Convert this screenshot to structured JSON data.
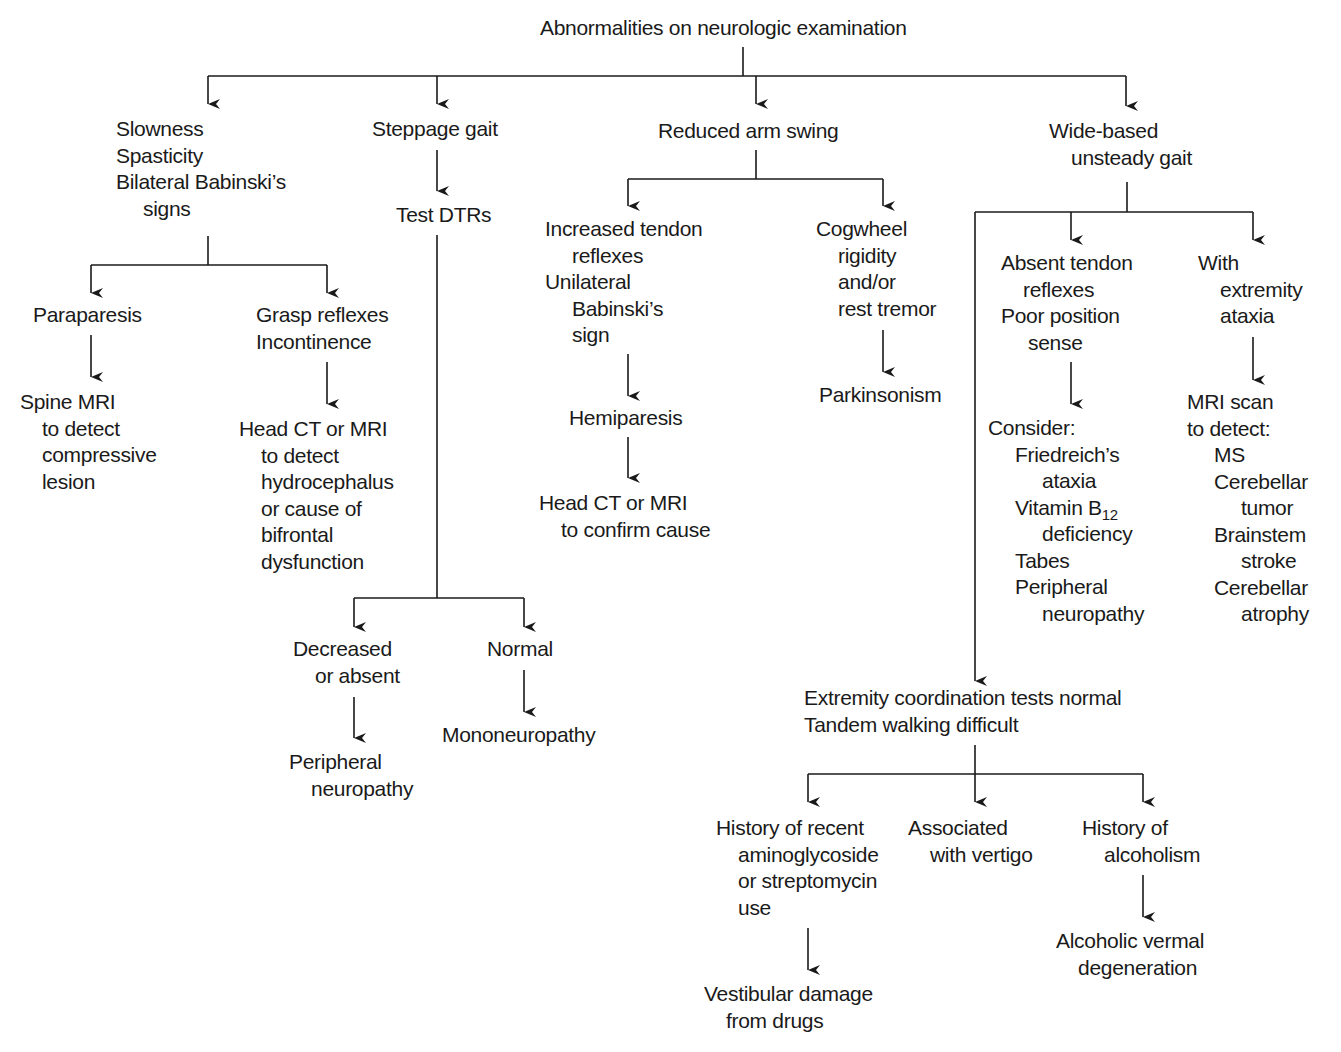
{
  "diagram": {
    "type": "flowchart",
    "root": {
      "id": "root",
      "lines": [
        "Abnormalities on neurologic examination"
      ]
    },
    "nodes": {
      "slowness": {
        "lines": [
          "Slowness",
          "Spasticity",
          "Bilateral Babinski’s",
          "signs"
        ]
      },
      "paraparesis": {
        "lines": [
          "Paraparesis"
        ]
      },
      "spine_mri": {
        "lines": [
          "Spine MRI",
          "to detect",
          "compressive",
          "lesion"
        ]
      },
      "grasp": {
        "lines": [
          "Grasp reflexes",
          "Incontinence"
        ]
      },
      "head_ct_hydro": {
        "lines": [
          "Head CT or MRI",
          "to detect",
          "hydrocephalus",
          "or cause of",
          "bifrontal",
          "dysfunction"
        ]
      },
      "steppage": {
        "lines": [
          "Steppage gait"
        ]
      },
      "test_dtrs": {
        "lines": [
          "Test DTRs"
        ]
      },
      "decreased": {
        "lines": [
          "Decreased",
          "or absent"
        ]
      },
      "peripheral_neuro_1": {
        "lines": [
          "Peripheral",
          "neuropathy"
        ]
      },
      "normal": {
        "lines": [
          "Normal"
        ]
      },
      "mononeuropathy": {
        "lines": [
          "Mononeuropathy"
        ]
      },
      "reduced_arm": {
        "lines": [
          "Reduced arm swing"
        ]
      },
      "increased_tendon": {
        "lines": [
          "Increased tendon",
          "reflexes",
          "Unilateral",
          "Babinski’s",
          "sign"
        ]
      },
      "hemiparesis": {
        "lines": [
          "Hemiparesis"
        ]
      },
      "head_ct_confirm": {
        "lines": [
          "Head CT or MRI",
          "to confirm cause"
        ]
      },
      "cogwheel": {
        "lines": [
          "Cogwheel",
          "rigidity",
          "and/or",
          "rest tremor"
        ]
      },
      "parkinsonism": {
        "lines": [
          "Parkinsonism"
        ]
      },
      "wide_based": {
        "lines": [
          "Wide-based",
          "unsteady gait"
        ]
      },
      "absent_tendon": {
        "lines": [
          "Absent tendon",
          "reflexes",
          "Poor position",
          "sense"
        ]
      },
      "consider": {
        "lines": [
          "Consider:",
          "Friedreich’s",
          "ataxia",
          "Vitamin B",
          "deficiency",
          "Tabes",
          "Peripheral",
          "neuropathy"
        ],
        "subscript": "12"
      },
      "extremity_ataxia": {
        "lines": [
          "With",
          "extremity",
          "ataxia"
        ]
      },
      "mri_scan": {
        "lines": [
          "MRI scan",
          "to detect:",
          "MS",
          "Cerebellar",
          "tumor",
          "Brainstem",
          "stroke",
          "Cerebellar",
          "atrophy"
        ]
      },
      "coordination_normal": {
        "lines": [
          "Extremity coordination tests normal",
          "Tandem walking difficult"
        ]
      },
      "aminoglycoside": {
        "lines": [
          "History of recent",
          "aminoglycoside",
          "or streptomycin",
          "use"
        ]
      },
      "vestibular": {
        "lines": [
          "Vestibular damage",
          "from drugs"
        ]
      },
      "vertigo": {
        "lines": [
          "Associated",
          "with vertigo"
        ]
      },
      "alcoholism": {
        "lines": [
          "History of",
          "alcoholism"
        ]
      },
      "vermal": {
        "lines": [
          "Alcoholic vermal",
          "degeneration"
        ]
      }
    },
    "edges": [
      [
        "root",
        "slowness"
      ],
      [
        "root",
        "steppage"
      ],
      [
        "root",
        "reduced_arm"
      ],
      [
        "root",
        "wide_based"
      ],
      [
        "slowness",
        "paraparesis"
      ],
      [
        "slowness",
        "grasp"
      ],
      [
        "paraparesis",
        "spine_mri"
      ],
      [
        "grasp",
        "head_ct_hydro"
      ],
      [
        "steppage",
        "test_dtrs"
      ],
      [
        "test_dtrs",
        "decreased"
      ],
      [
        "test_dtrs",
        "normal"
      ],
      [
        "decreased",
        "peripheral_neuro_1"
      ],
      [
        "normal",
        "mononeuropathy"
      ],
      [
        "reduced_arm",
        "increased_tendon"
      ],
      [
        "reduced_arm",
        "cogwheel"
      ],
      [
        "increased_tendon",
        "hemiparesis"
      ],
      [
        "hemiparesis",
        "head_ct_confirm"
      ],
      [
        "cogwheel",
        "parkinsonism"
      ],
      [
        "wide_based",
        "absent_tendon"
      ],
      [
        "wide_based",
        "extremity_ataxia"
      ],
      [
        "wide_based",
        "coordination_normal"
      ],
      [
        "absent_tendon",
        "consider"
      ],
      [
        "extremity_ataxia",
        "mri_scan"
      ],
      [
        "coordination_normal",
        "aminoglycoside"
      ],
      [
        "coordination_normal",
        "vertigo"
      ],
      [
        "coordination_normal",
        "alcoholism"
      ],
      [
        "aminoglycoside",
        "vestibular"
      ],
      [
        "alcoholism",
        "vermal"
      ]
    ],
    "colors": {
      "ink": "#1a1a1a",
      "background": "#ffffff"
    }
  }
}
